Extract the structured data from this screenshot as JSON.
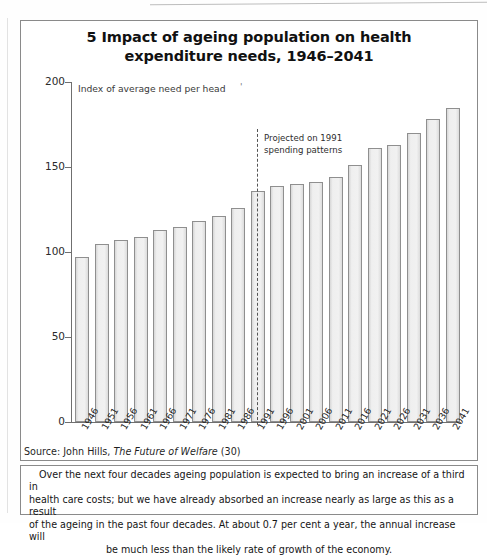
{
  "figure": {
    "title": "5 Impact of ageing population on health expenditure needs, 1946–2041",
    "title_line1": "5 Impact of ageing population on health",
    "title_line2": "expenditure needs, 1946–2041",
    "axis_caption": "Index of average need per head",
    "stray_mark": "'",
    "projection_note": "Projected on 1991\nspending patterns",
    "source": {
      "prefix": "Source: John Hills, ",
      "italic": "The Future of Welfare",
      "suffix": " (30)"
    },
    "caption": {
      "line1": "Over the next four decades ageing population is expected to bring an increase of a third in",
      "line2": "health care costs; but we have already absorbed an increase nearly as  large as this as a result",
      "line3": "of the ageing in the past four decades. At about 0.7 per cent a year, the annual increase will",
      "line4": "be much less than the likely rate of growth of the economy."
    }
  },
  "chart_data": {
    "type": "bar",
    "title": "5 Impact of ageing population on health expenditure needs, 1946–2041",
    "subtitle": "Index of average need per head",
    "xlabel": "",
    "ylabel": "Index of average need per head",
    "ylim": [
      0,
      200
    ],
    "yticks": [
      0,
      50,
      100,
      150,
      200
    ],
    "ytick_labels": [
      "0",
      "50",
      "100",
      "150",
      "200"
    ],
    "grid": false,
    "legend": "none",
    "categories": [
      "1946",
      "1951",
      "1956",
      "1961",
      "1966",
      "1971",
      "1976",
      "1981",
      "1986",
      "1991",
      "1996",
      "2001",
      "2006",
      "2011",
      "2016",
      "2021",
      "2026",
      "2031",
      "2036",
      "2041"
    ],
    "values": [
      97,
      105,
      107,
      109,
      113,
      115,
      118,
      121,
      126,
      136,
      139,
      140,
      141,
      144,
      151,
      161,
      163,
      170,
      178,
      185
    ],
    "annotations": [
      {
        "text": "Projected on 1991 spending patterns",
        "type": "vertical-dashed-divider",
        "at_category": "1991"
      }
    ],
    "bar_fill": "#eeeeee",
    "bar_edge": "#8f8f8f"
  },
  "colors": {
    "frame": "#8a8a8a",
    "axis": "#6f6f6f",
    "text": "#151515",
    "bar_fill": "#eeeeee",
    "bar_edge": "#8f8f8f",
    "dashed_line": "#555555"
  }
}
